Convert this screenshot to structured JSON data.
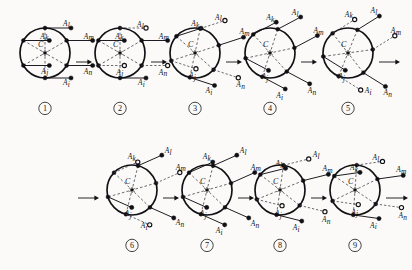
{
  "figure": {
    "background_color": "#fbfaf8",
    "ink_color": "#111015",
    "dash_color": "#3a3840",
    "center_label": "C",
    "node_labels": [
      "A",
      "A",
      "A",
      "A",
      "A",
      "A"
    ],
    "subscripts": [
      "k",
      "l",
      "m",
      "j",
      "i",
      "n"
    ],
    "marker_legend": {
      "filled": "filled-dot",
      "hollow": "hollow-dot"
    },
    "rows": [
      {
        "panels": [
          "1",
          "2",
          "3",
          "4",
          "5"
        ]
      },
      {
        "panels": [
          "6",
          "7",
          "8",
          "9"
        ]
      }
    ],
    "panels": [
      {
        "id": "1",
        "number_label": "①",
        "cx": 45,
        "cy": 53,
        "r": 25,
        "rotation_deg": 0,
        "stem_angle_deg": 90,
        "stem_len": 26,
        "center_marker": "star",
        "center_label": "C",
        "nodes": [
          {
            "sub": "k",
            "angle_deg": 210,
            "marker": "filled",
            "label_side": "left",
            "label_dx": -9,
            "label_dy": -2
          },
          {
            "sub": "l",
            "angle_deg": 270,
            "marker": "filled",
            "label_side": "left",
            "label_dx": -8,
            "label_dy": -2
          },
          {
            "sub": "m",
            "angle_deg": 330,
            "marker": "filled",
            "label_side": "left",
            "label_dx": -9,
            "label_dy": -2
          },
          {
            "sub": "j",
            "angle_deg": 150,
            "marker": "filled",
            "label_side": "left",
            "label_dx": -8,
            "label_dy": 8
          },
          {
            "sub": "i",
            "angle_deg": 90,
            "marker": "filled",
            "label_side": "left",
            "label_dx": -8,
            "label_dy": 7
          },
          {
            "sub": "n",
            "angle_deg": 30,
            "marker": "filled",
            "label_side": "left",
            "label_dx": -9,
            "label_dy": 8
          }
        ]
      },
      {
        "id": "2",
        "number_label": "②",
        "cx": 120,
        "cy": 53,
        "r": 25,
        "rotation_deg": 0,
        "stem_angle_deg": 90,
        "stem_len": 26,
        "center_marker": "star",
        "center_label": "C",
        "nodes": [
          {
            "sub": "k",
            "angle_deg": 210,
            "marker": "filled",
            "label_side": "left",
            "label_dx": -9,
            "label_dy": -2
          },
          {
            "sub": "l",
            "angle_deg": 270,
            "marker": "hollow",
            "label_side": "left",
            "label_dx": -9,
            "label_dy": -1
          },
          {
            "sub": "m",
            "angle_deg": 330,
            "marker": "filled",
            "label_side": "left",
            "label_dx": -9,
            "label_dy": -2
          },
          {
            "sub": "j",
            "angle_deg": 150,
            "marker": "hollow",
            "label_side": "left",
            "label_dx": -8,
            "label_dy": 9
          },
          {
            "sub": "i",
            "angle_deg": 90,
            "marker": "filled",
            "label_side": "left",
            "label_dx": -8,
            "label_dy": 7
          },
          {
            "sub": "n",
            "angle_deg": 30,
            "marker": "hollow",
            "label_side": "left",
            "label_dx": -9,
            "label_dy": 9
          }
        ]
      },
      {
        "id": "3",
        "number_label": "③",
        "cx": 195,
        "cy": 53,
        "r": 25,
        "rotation_deg": 12,
        "stem_angle_deg": 72,
        "stem_len": 26,
        "center_marker": "star",
        "center_label": "C",
        "nodes": [
          {
            "sub": "k",
            "angle_deg": 210,
            "marker": "filled",
            "label_side": "left",
            "label_dx": -10,
            "label_dy": -2
          },
          {
            "sub": "l",
            "angle_deg": 270,
            "marker": "hollow",
            "label_side": "left",
            "label_dx": -10,
            "label_dy": -1
          },
          {
            "sub": "m",
            "angle_deg": 330,
            "marker": "filled",
            "label_side": "left",
            "label_dx": -4,
            "label_dy": -3
          },
          {
            "sub": "j",
            "angle_deg": 150,
            "marker": "hollow",
            "label_side": "left",
            "label_dx": -7,
            "label_dy": 9
          },
          {
            "sub": "i",
            "angle_deg": 90,
            "marker": "filled",
            "label_side": "left",
            "label_dx": -9,
            "label_dy": 8
          },
          {
            "sub": "n",
            "angle_deg": 30,
            "marker": "hollow",
            "label_side": "left",
            "label_dx": -2,
            "label_dy": 9
          }
        ]
      },
      {
        "id": "4",
        "number_label": "④",
        "cx": 270,
        "cy": 53,
        "r": 25,
        "rotation_deg": 18,
        "stem_angle_deg": 62,
        "stem_len": 26,
        "center_marker": "star",
        "center_label": "C",
        "nodes": [
          {
            "sub": "k",
            "angle_deg": 210,
            "marker": "filled",
            "label_side": "left",
            "label_dx": -10,
            "label_dy": -2
          },
          {
            "sub": "l",
            "angle_deg": 270,
            "marker": "filled",
            "label_side": "left",
            "label_dx": -9,
            "label_dy": -2
          },
          {
            "sub": "m",
            "angle_deg": 330,
            "marker": "filled",
            "label_side": "left",
            "label_dx": -4,
            "label_dy": -3
          },
          {
            "sub": "j",
            "angle_deg": 150,
            "marker": "filled",
            "label_side": "left",
            "label_dx": -7,
            "label_dy": 9
          },
          {
            "sub": "i",
            "angle_deg": 90,
            "marker": "filled",
            "label_side": "left",
            "label_dx": -9,
            "label_dy": 9
          },
          {
            "sub": "n",
            "angle_deg": 30,
            "marker": "filled",
            "label_side": "left",
            "label_dx": -2,
            "label_dy": 9
          }
        ]
      },
      {
        "id": "5",
        "number_label": "⑤",
        "cx": 348,
        "cy": 53,
        "r": 25,
        "rotation_deg": 22,
        "stem_angle_deg": 58,
        "stem_len": 26,
        "center_marker": "star",
        "center_label": "C",
        "nodes": [
          {
            "sub": "k",
            "angle_deg": 210,
            "marker": "hollow",
            "label_side": "left",
            "label_dx": -10,
            "label_dy": -3
          },
          {
            "sub": "l",
            "angle_deg": 270,
            "marker": "filled",
            "label_side": "left",
            "label_dx": -9,
            "label_dy": -3
          },
          {
            "sub": "m",
            "angle_deg": 330,
            "marker": "hollow",
            "label_side": "left",
            "label_dx": -4,
            "label_dy": -3
          },
          {
            "sub": "j",
            "angle_deg": 150,
            "marker": "filled",
            "label_side": "left",
            "label_dx": -7,
            "label_dy": 9
          },
          {
            "sub": "i",
            "angle_deg": 90,
            "marker": "hollow",
            "label_side": "right",
            "label_dx": 4,
            "label_dy": 3
          },
          {
            "sub": "n",
            "angle_deg": 30,
            "marker": "filled",
            "label_side": "left",
            "label_dx": -2,
            "label_dy": 9
          }
        ]
      },
      {
        "id": "6",
        "number_label": "⑥",
        "cx": 132,
        "cy": 190,
        "r": 25,
        "rotation_deg": 14,
        "stem_angle_deg": 66,
        "stem_len": 26,
        "center_marker": "star",
        "center_label": "C",
        "nodes": [
          {
            "sub": "k",
            "angle_deg": 210,
            "marker": "hollow",
            "label_side": "left",
            "label_dx": -10,
            "label_dy": -3
          },
          {
            "sub": "l",
            "angle_deg": 270,
            "marker": "filled",
            "label_side": "right",
            "label_dx": 3,
            "label_dy": -2
          },
          {
            "sub": "m",
            "angle_deg": 330,
            "marker": "hollow",
            "label_side": "left",
            "label_dx": -4,
            "label_dy": -3
          },
          {
            "sub": "j",
            "angle_deg": 150,
            "marker": "filled",
            "label_side": "left",
            "label_dx": -7,
            "label_dy": 9
          },
          {
            "sub": "i",
            "angle_deg": 90,
            "marker": "hollow",
            "label_side": "left",
            "label_dx": -9,
            "label_dy": 3
          },
          {
            "sub": "n",
            "angle_deg": 30,
            "marker": "filled",
            "label_side": "right",
            "label_dx": 2,
            "label_dy": 7
          }
        ]
      },
      {
        "id": "7",
        "number_label": "⑦",
        "cx": 207,
        "cy": 190,
        "r": 25,
        "rotation_deg": 14,
        "stem_angle_deg": 66,
        "stem_len": 26,
        "center_marker": "star",
        "center_label": "C",
        "nodes": [
          {
            "sub": "k",
            "angle_deg": 210,
            "marker": "filled",
            "label_side": "left",
            "label_dx": -10,
            "label_dy": -3
          },
          {
            "sub": "l",
            "angle_deg": 270,
            "marker": "filled",
            "label_side": "right",
            "label_dx": 3,
            "label_dy": -2
          },
          {
            "sub": "m",
            "angle_deg": 330,
            "marker": "filled",
            "label_side": "left",
            "label_dx": -4,
            "label_dy": -3
          },
          {
            "sub": "j",
            "angle_deg": 150,
            "marker": "filled",
            "label_side": "left",
            "label_dx": -7,
            "label_dy": 9
          },
          {
            "sub": "i",
            "angle_deg": 90,
            "marker": "filled",
            "label_side": "left",
            "label_dx": -9,
            "label_dy": 8
          },
          {
            "sub": "n",
            "angle_deg": 30,
            "marker": "filled",
            "label_side": "right",
            "label_dx": 2,
            "label_dy": 8
          }
        ]
      },
      {
        "id": "8",
        "number_label": "⑧",
        "cx": 280,
        "cy": 190,
        "r": 25,
        "rotation_deg": 8,
        "stem_angle_deg": 76,
        "stem_len": 26,
        "center_marker": "star",
        "center_label": "C",
        "nodes": [
          {
            "sub": "k",
            "angle_deg": 210,
            "marker": "filled",
            "label_side": "left",
            "label_dx": -10,
            "label_dy": -2
          },
          {
            "sub": "l",
            "angle_deg": 270,
            "marker": "hollow",
            "label_side": "right",
            "label_dx": 4,
            "label_dy": -2
          },
          {
            "sub": "m",
            "angle_deg": 330,
            "marker": "filled",
            "label_side": "left",
            "label_dx": -6,
            "label_dy": -3
          },
          {
            "sub": "j",
            "angle_deg": 150,
            "marker": "hollow",
            "label_side": "left",
            "label_dx": -7,
            "label_dy": 10
          },
          {
            "sub": "i",
            "angle_deg": 90,
            "marker": "filled",
            "label_side": "left",
            "label_dx": -9,
            "label_dy": 9
          },
          {
            "sub": "n",
            "angle_deg": 30,
            "marker": "hollow",
            "label_side": "left",
            "label_dx": -3,
            "label_dy": 10
          }
        ]
      },
      {
        "id": "9",
        "number_label": "⑨",
        "cx": 355,
        "cy": 190,
        "r": 25,
        "rotation_deg": 4,
        "stem_angle_deg": 82,
        "stem_len": 26,
        "center_marker": "star",
        "center_label": "C",
        "nodes": [
          {
            "sub": "k",
            "angle_deg": 210,
            "marker": "filled",
            "label_side": "left",
            "label_dx": -10,
            "label_dy": -2
          },
          {
            "sub": "l",
            "angle_deg": 270,
            "marker": "hollow",
            "label_side": "left",
            "label_dx": -10,
            "label_dy": -1
          },
          {
            "sub": "m",
            "angle_deg": 330,
            "marker": "filled",
            "label_side": "left",
            "label_dx": -7,
            "label_dy": -3
          },
          {
            "sub": "j",
            "angle_deg": 150,
            "marker": "hollow",
            "label_side": "left",
            "label_dx": -7,
            "label_dy": 10
          },
          {
            "sub": "i",
            "angle_deg": 90,
            "marker": "filled",
            "label_side": "left",
            "label_dx": -9,
            "label_dy": 9
          },
          {
            "sub": "n",
            "angle_deg": 30,
            "marker": "hollow",
            "label_side": "left",
            "label_dx": -3,
            "label_dy": 10
          }
        ]
      }
    ],
    "arrows": [
      {
        "name": "arrow-1-2",
        "x1": 76,
        "y": 62,
        "x2": 92
      },
      {
        "name": "arrow-2-3",
        "x1": 151,
        "y": 62,
        "x2": 167
      },
      {
        "name": "arrow-3-4",
        "x1": 226,
        "y": 62,
        "x2": 242
      },
      {
        "name": "arrow-4-5",
        "x1": 301,
        "y": 62,
        "x2": 317
      },
      {
        "name": "arrow-5-out",
        "x1": 379,
        "y": 62,
        "x2": 400
      },
      {
        "name": "arrow-in-6",
        "x1": 78,
        "y": 198,
        "x2": 99
      },
      {
        "name": "arrow-6-7",
        "x1": 163,
        "y": 198,
        "x2": 179
      },
      {
        "name": "arrow-7-8",
        "x1": 238,
        "y": 198,
        "x2": 254
      },
      {
        "name": "arrow-8-9",
        "x1": 311,
        "y": 198,
        "x2": 327
      },
      {
        "name": "arrow-9-out",
        "x1": 386,
        "y": 198,
        "x2": 408
      }
    ]
  }
}
